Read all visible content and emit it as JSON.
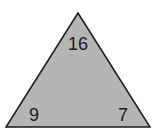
{
  "diagram": {
    "shape": "triangle",
    "fill_color": "#b5b5b5",
    "stroke_color": "#1a1a1a",
    "numbers": {
      "top": "16",
      "bottom_left": "9",
      "bottom_right": "7"
    }
  }
}
